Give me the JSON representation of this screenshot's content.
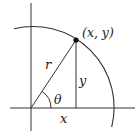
{
  "diagram": {
    "type": "polar-coordinates-unit-circle",
    "labels": {
      "point": "(x, y)",
      "radius": "r",
      "opposite": "y",
      "angle": "θ",
      "adjacent": "x"
    },
    "colors": {
      "stroke": "#333333",
      "background": "#ffffff"
    }
  }
}
